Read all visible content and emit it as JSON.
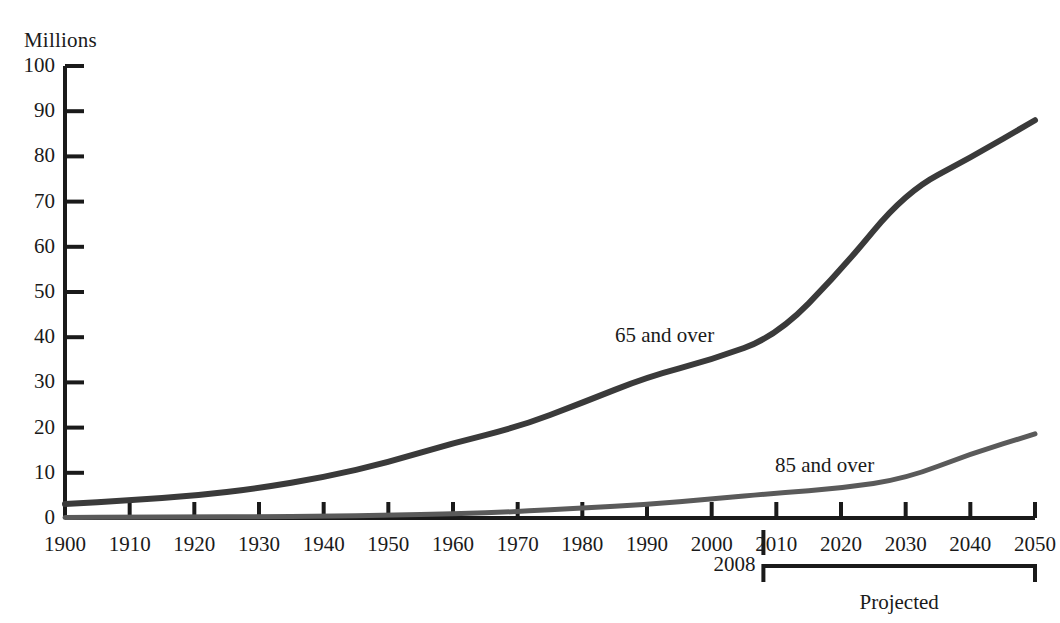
{
  "chart_data": {
    "type": "line",
    "title": "",
    "subtitle": "",
    "xlabel": "",
    "ylabel": "Millions",
    "ylim": [
      0,
      100
    ],
    "xlim": [
      1900,
      2050
    ],
    "grid": false,
    "legend_position": "inline-annotation",
    "x": [
      1900,
      1910,
      1920,
      1930,
      1940,
      1950,
      1960,
      1970,
      1980,
      1990,
      2000,
      2010,
      2020,
      2030,
      2040,
      2050
    ],
    "xtick_labels": [
      "1900",
      "1910",
      "1920",
      "1930",
      "1940",
      "1950",
      "1960",
      "1970",
      "1980",
      "1990",
      "2000",
      "2010",
      "2020",
      "2030",
      "2040",
      "2050"
    ],
    "ytick_labels": [
      "0",
      "10",
      "20",
      "30",
      "40",
      "50",
      "60",
      "70",
      "80",
      "90",
      "100"
    ],
    "ytick_values": [
      0,
      10,
      20,
      30,
      40,
      50,
      60,
      70,
      80,
      90,
      100
    ],
    "series": [
      {
        "name": "65 and over",
        "color": "#3a3a3a",
        "values": [
          3.1,
          3.9,
          4.9,
          6.6,
          9.0,
          12.3,
          16.6,
          20.1,
          25.5,
          31.2,
          35.0,
          40.2,
          54.8,
          72.1,
          79.7,
          88.0
        ]
      },
      {
        "name": "85 and over",
        "color": "#5a5a5a",
        "values": [
          0.1,
          0.2,
          0.2,
          0.3,
          0.4,
          0.6,
          0.9,
          1.4,
          2.2,
          3.0,
          4.2,
          5.5,
          6.6,
          8.7,
          14.2,
          18.6
        ]
      }
    ],
    "annotations": [
      {
        "name": "series-label-65",
        "text": "65 and over"
      },
      {
        "name": "series-label-85",
        "text": "85 and over"
      },
      {
        "name": "year-marker",
        "text": "2008"
      },
      {
        "name": "projection-bracket",
        "text": "Projected"
      }
    ],
    "projection_start_year": 2008
  },
  "axis": {
    "unit_label": "Millions"
  },
  "markers": {
    "divider_year": "2008",
    "projected_label": "Projected"
  },
  "colors": {
    "axis": "#1a1a1a",
    "series_65": "#3a3a3a",
    "series_85": "#5a5a5a",
    "background": "#ffffff"
  }
}
